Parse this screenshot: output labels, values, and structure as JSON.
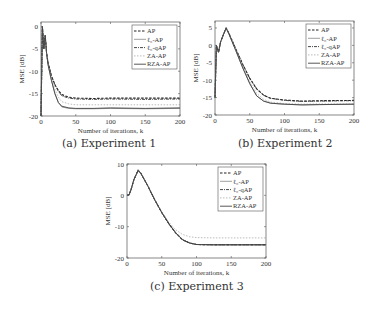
{
  "captions": {
    "a": "(a) Experiment 1",
    "b": "(b) Experiment 2",
    "c": "(c) Experiment 3"
  },
  "legend": [
    "AP",
    "ℓ₀-AP",
    "ℓ₀-qAP",
    "ZA-AP",
    "RZA-AP"
  ],
  "xlabel": "Number of iterations, k",
  "ylabel": "MSE [dB]",
  "chart_data": [
    {
      "type": "line",
      "title": "(a) Experiment 1",
      "xlabel": "Number of iterations, k",
      "ylabel": "MSE [dB]",
      "xlim": [
        0,
        200
      ],
      "ylim": [
        -20,
        1
      ],
      "xticks": [
        0,
        50,
        100,
        150,
        200
      ],
      "yticks": [
        0,
        -5,
        -10,
        -15,
        -20
      ],
      "legend_position": "upper right",
      "grid": false,
      "x": [
        0,
        2,
        4,
        6,
        8,
        10,
        15,
        20,
        25,
        30,
        40,
        50,
        75,
        100,
        150,
        200
      ],
      "series": [
        {
          "name": "AP",
          "values": [
            -20,
            0,
            -5,
            -2,
            -6,
            -8,
            -11,
            -13,
            -14.3,
            -15.2,
            -15.8,
            -16.0,
            -16.1,
            -16.0,
            -16.0,
            -16.0
          ]
        },
        {
          "name": "ℓ0-AP",
          "values": [
            -20,
            0,
            -5,
            -2,
            -6,
            -8.5,
            -12,
            -15,
            -17,
            -18,
            -18.3,
            -18.4,
            -18.4,
            -18.3,
            -18.4,
            -18.3
          ]
        },
        {
          "name": "ℓ0-qAP",
          "values": [
            -20,
            0,
            -5,
            -2,
            -6,
            -8,
            -11,
            -13,
            -14.5,
            -15.5,
            -16.0,
            -16.2,
            -16.3,
            -16.2,
            -16.3,
            -16.2
          ]
        },
        {
          "name": "ZA-AP",
          "values": [
            -20,
            0,
            -5,
            -2,
            -6,
            -8.3,
            -11.5,
            -14,
            -15.8,
            -16.8,
            -17.3,
            -17.5,
            -17.5,
            -17.5,
            -17.5,
            -17.5
          ]
        },
        {
          "name": "RZA-AP",
          "values": [
            -20,
            0,
            -5,
            -2,
            -6,
            -8.5,
            -12,
            -15,
            -17,
            -17.8,
            -18.2,
            -18.3,
            -18.3,
            -18.2,
            -18.3,
            -18.2
          ]
        }
      ]
    },
    {
      "type": "line",
      "title": "(b) Experiment 2",
      "xlabel": "Number of iterations, k",
      "ylabel": "MSE [dB]",
      "xlim": [
        0,
        200
      ],
      "ylim": [
        -20,
        7
      ],
      "xticks": [
        0,
        50,
        100,
        150,
        200
      ],
      "yticks": [
        5,
        0,
        -5,
        -10,
        -15,
        -20
      ],
      "legend_position": "upper right",
      "grid": false,
      "x": [
        0,
        2,
        5,
        8,
        12,
        16,
        20,
        30,
        40,
        50,
        60,
        70,
        80,
        100,
        125,
        150,
        200
      ],
      "series": [
        {
          "name": "AP",
          "values": [
            -15,
            0,
            -2,
            1,
            3,
            5,
            3.5,
            -1,
            -5.5,
            -9.5,
            -12.5,
            -14.3,
            -15.2,
            -15.7,
            -16.0,
            -15.9,
            -15.8
          ]
        },
        {
          "name": "ℓ0-AP",
          "values": [
            -15,
            0,
            -2,
            1,
            3,
            5,
            3.3,
            -1.5,
            -6.5,
            -11,
            -14.5,
            -16.0,
            -16.6,
            -16.9,
            -17.1,
            -17.0,
            -16.9
          ]
        },
        {
          "name": "ℓ0-qAP",
          "values": [
            -15,
            0,
            -2,
            1,
            3,
            5,
            3.5,
            -1,
            -5.5,
            -9.5,
            -12.5,
            -14.3,
            -15.2,
            -15.8,
            -16.1,
            -16.0,
            -15.9
          ]
        },
        {
          "name": "ZA-AP",
          "values": [
            -15,
            0,
            -2,
            1,
            3,
            5,
            3.4,
            -1.2,
            -6,
            -10.5,
            -13.8,
            -15.5,
            -16.3,
            -16.7,
            -16.9,
            -16.8,
            -16.8
          ]
        },
        {
          "name": "RZA-AP",
          "values": [
            -15,
            0,
            -2,
            1,
            3,
            5,
            3.3,
            -1.5,
            -6.5,
            -11,
            -14.5,
            -16.0,
            -16.6,
            -16.9,
            -17.1,
            -17.0,
            -16.9
          ]
        }
      ]
    },
    {
      "type": "line",
      "title": "(c) Experiment 3",
      "xlabel": "Number of iterations, k",
      "ylabel": "MSE [dB]",
      "xlim": [
        0,
        200
      ],
      "ylim": [
        -20,
        10
      ],
      "xticks": [
        0,
        50,
        100,
        150,
        200
      ],
      "yticks": [
        10,
        0,
        -10,
        -20
      ],
      "legend_position": "upper right",
      "grid": false,
      "x": [
        0,
        3,
        6,
        10,
        16,
        20,
        30,
        40,
        50,
        60,
        70,
        80,
        90,
        100,
        125,
        150,
        200
      ],
      "series": [
        {
          "name": "AP",
          "values": [
            0,
            0.2,
            2,
            5,
            8,
            7,
            3,
            -1.5,
            -5.5,
            -9,
            -12,
            -14.2,
            -15.2,
            -15.7,
            -15.8,
            -15.8,
            -15.8
          ]
        },
        {
          "name": "ℓ0-AP",
          "values": [
            0,
            0.2,
            2,
            5,
            8,
            7,
            3,
            -1.5,
            -5.5,
            -9,
            -12,
            -14.2,
            -15.2,
            -15.7,
            -15.8,
            -15.8,
            -15.8
          ]
        },
        {
          "name": "ℓ0-qAP",
          "values": [
            0,
            0.2,
            2,
            5,
            8,
            7,
            3,
            -1.5,
            -5.5,
            -9,
            -12,
            -14.2,
            -15.2,
            -15.7,
            -15.8,
            -15.8,
            -15.8
          ]
        },
        {
          "name": "ZA-AP",
          "values": [
            0,
            0.2,
            2,
            5,
            8,
            7,
            3,
            -1.5,
            -5.3,
            -8.5,
            -11,
            -12.5,
            -13.2,
            -13.5,
            -13.6,
            -13.6,
            -13.6
          ]
        },
        {
          "name": "RZA-AP",
          "values": [
            0,
            0.2,
            2,
            5,
            8,
            7,
            3,
            -1.5,
            -5.5,
            -9,
            -12,
            -14.2,
            -15.2,
            -15.7,
            -15.8,
            -15.8,
            -15.8
          ]
        }
      ]
    }
  ],
  "styles": {
    "AP": {
      "color": "#222222",
      "dash": "2.5,1.5",
      "width": 1.1
    },
    "ℓ0-AP": {
      "color": "#777777",
      "dash": "",
      "width": 0.7
    },
    "ℓ0-qAP": {
      "color": "#333333",
      "dash": "3,1,1,1",
      "width": 0.9
    },
    "ZA-AP": {
      "color": "#aaaaaa",
      "dash": "1.5,1.5",
      "width": 0.8
    },
    "RZA-AP": {
      "color": "#444444",
      "dash": "",
      "width": 0.9
    }
  }
}
